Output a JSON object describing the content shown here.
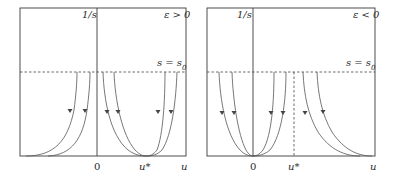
{
  "figure": {
    "panels": [
      {
        "id": "left",
        "condition": "ε > 0",
        "y_axis_label": "1/s",
        "x_axis_label": "u",
        "threshold_label": "s = s",
        "threshold_sub": "0",
        "tick_zero": "0",
        "tick_ustar": "u*"
      },
      {
        "id": "right",
        "condition": "ε < 0",
        "y_axis_label": "1/s",
        "x_axis_label": "u",
        "threshold_label": "s = s",
        "threshold_sub": "0",
        "tick_zero": "0",
        "tick_ustar": "u*"
      }
    ]
  }
}
